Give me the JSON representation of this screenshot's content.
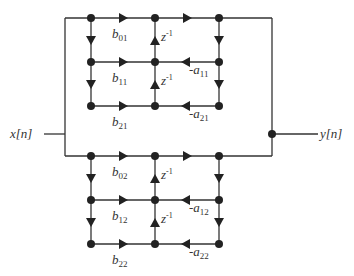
{
  "diagram": {
    "input_label": "x[n]",
    "output_label": "y[n]",
    "delay_label": "z",
    "delay_exp": "-1",
    "sections": [
      {
        "id": 1,
        "b": [
          {
            "base": "b",
            "sub": "01"
          },
          {
            "base": "b",
            "sub": "11"
          },
          {
            "base": "b",
            "sub": "21"
          }
        ],
        "a": [
          {
            "base": "-a",
            "sub": "11"
          },
          {
            "base": "-a",
            "sub": "21"
          }
        ]
      },
      {
        "id": 2,
        "b": [
          {
            "base": "b",
            "sub": "02"
          },
          {
            "base": "b",
            "sub": "12"
          },
          {
            "base": "b",
            "sub": "22"
          }
        ],
        "a": [
          {
            "base": "-a",
            "sub": "12"
          },
          {
            "base": "-a",
            "sub": "22"
          }
        ]
      }
    ],
    "colors": {
      "line": "#333333",
      "node": "#222222",
      "background": "#ffffff"
    }
  }
}
